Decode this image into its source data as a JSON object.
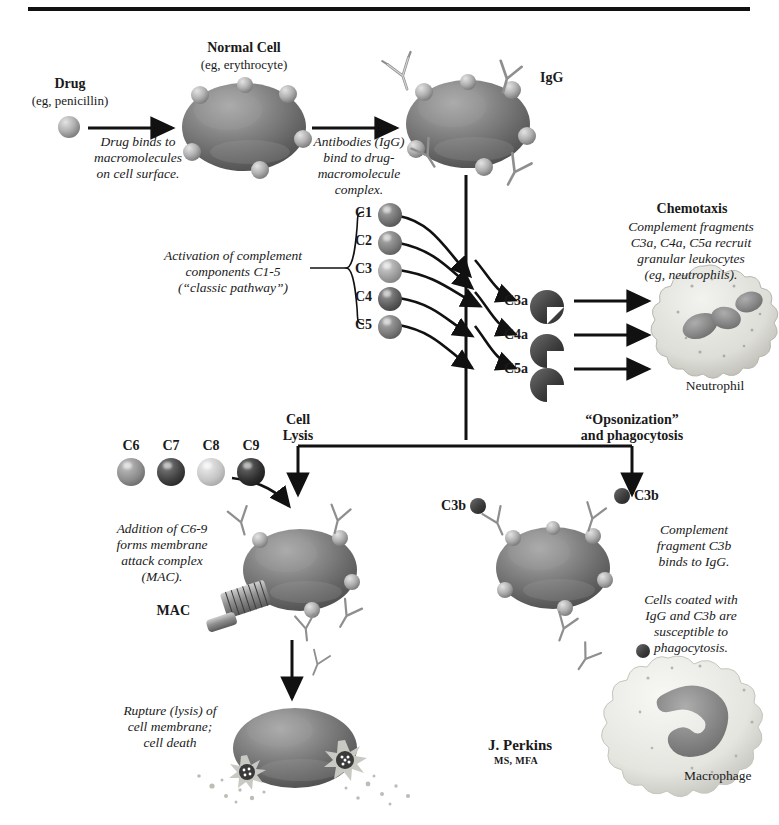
{
  "page": {
    "running_head_left": "",
    "running_head_right": ""
  },
  "colors": {
    "ink": "#111111",
    "cell_body": "#7d7d7d",
    "cell_body_dark": "#5e5e5e",
    "receptor": "#b4b4b4",
    "igg": "#c9c9c9",
    "neutrophil_cyto": "#e4e4e0",
    "neutrophil_nucleus": "#8a8a8a",
    "macrophage_cyto": "#ebebe8",
    "macrophage_nucleus": "#9a9a9a",
    "sphere_mid": "#8b8b8b",
    "sphere_dark": "#4a4a4a",
    "sphere_light": "#c2c2c2",
    "sphere_darkest": "#333333"
  },
  "steps": {
    "drug": {
      "title": "Drug",
      "subtitle": "(eg, penicillin)"
    },
    "normal_cell": {
      "title": "Normal Cell",
      "subtitle": "(eg, erythrocyte)"
    },
    "arrow1_caption": "Drug binds to\nmacromolecules\non cell surface.",
    "arrow2_caption": "Antibodies (IgG)\nbind to drug-\nmacromolecule\ncomplex.",
    "igg_label": "IgG"
  },
  "complement": {
    "activation_caption": "Activation of complement\ncomponents C1-5\n(“classic pathway”)",
    "components": [
      {
        "label": "C1",
        "shade": "#6f6f6f"
      },
      {
        "label": "C2",
        "shade": "#7a7a7a"
      },
      {
        "label": "C3",
        "shade": "#9b9b9b"
      },
      {
        "label": "C4",
        "shade": "#5a5a5a"
      },
      {
        "label": "C5",
        "shade": "#777777"
      }
    ],
    "mac_components": [
      {
        "label": "C6",
        "shade": "#8b8b8b"
      },
      {
        "label": "C7",
        "shade": "#3f3f3f"
      },
      {
        "label": "C8",
        "shade": "#c4c4c4"
      },
      {
        "label": "C9",
        "shade": "#2e2e2e"
      }
    ]
  },
  "chemotaxis": {
    "title": "Chemotaxis",
    "caption": "Complement fragments\nC3a, C4a, C5a recruit\ngranular leukocytes\n(eg, neutrophils).",
    "fragments": [
      "C3a",
      "C4a",
      "C5a"
    ],
    "cell_label": "Neutrophil"
  },
  "lysis": {
    "branch_label": "Cell\nLysis",
    "caption_mac": "Addition of C6-9\nforms membrane\nattack complex\n(MAC).",
    "mac_label": "MAC",
    "caption_rupture": "Rupture (lysis) of\ncell membrane;\ncell death"
  },
  "opsonization": {
    "branch_label": "“Opsonization”\nand phagocytosis",
    "c3b_label_left": "C3b",
    "c3b_label_right": "C3b",
    "caption_bind": "Complement\nfragment C3b\nbinds to IgG.",
    "caption_coated": "Cells coated with\nIgG and C3b are\nsusceptible to\nphagocytosis.",
    "cell_label": "Macrophage"
  },
  "credit": {
    "name": "J. Perkins",
    "degrees": "MS, MFA"
  }
}
